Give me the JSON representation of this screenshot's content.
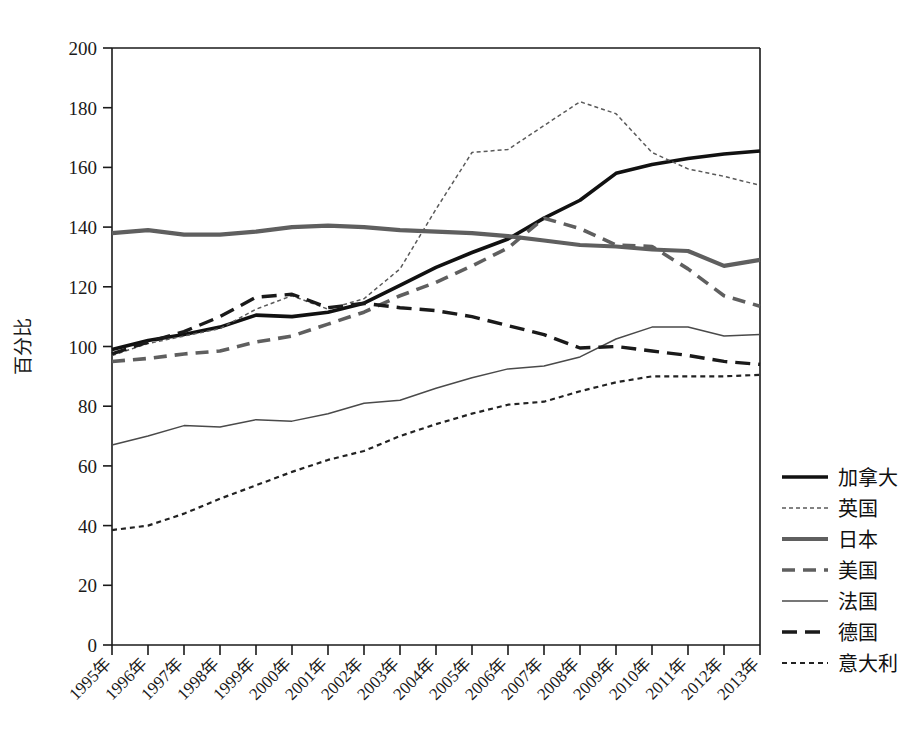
{
  "chart_data": {
    "type": "line",
    "title": "",
    "xlabel": "",
    "ylabel": "百分比",
    "ylim": [
      0,
      200
    ],
    "ytick_step": 20,
    "grid": false,
    "legend_position": "right",
    "x": [
      "1995年",
      "1996年",
      "1997年",
      "1998年",
      "1999年",
      "2000年",
      "2001年",
      "2002年",
      "2003年",
      "2004年",
      "2005年",
      "2006年",
      "2007年",
      "2008年",
      "2009年",
      "2010年",
      "2011年",
      "2012年",
      "2013年"
    ],
    "yticks": [
      0,
      20,
      40,
      60,
      80,
      100,
      120,
      140,
      160,
      180,
      200
    ],
    "series": [
      {
        "name": "加拿大",
        "style": "solid-thick-black",
        "color": "#111111",
        "width": 3.6,
        "dash": "",
        "values": [
          99,
          102,
          104,
          106.5,
          110.5,
          110,
          111.5,
          114.5,
          120.5,
          126.5,
          131.5,
          136,
          143,
          149,
          158,
          161,
          163,
          164.5,
          165.5
        ]
      },
      {
        "name": "英国",
        "style": "dotted-thin-gray",
        "color": "#5a5a5a",
        "width": 1.5,
        "dash": "4,3",
        "values": [
          97,
          101,
          103.5,
          106,
          112.5,
          117,
          112.5,
          116,
          126,
          146,
          165,
          166,
          174,
          182,
          178,
          165,
          159.5,
          157,
          154
        ]
      },
      {
        "name": "日本",
        "style": "solid-thick-gray",
        "color": "#5f5f5f",
        "width": 4.2,
        "dash": "",
        "values": [
          138,
          139,
          137.5,
          137.5,
          138.5,
          140,
          140.5,
          140,
          139,
          138.5,
          138,
          137,
          135.5,
          134,
          133.5,
          132.5,
          132,
          127,
          129
        ]
      },
      {
        "name": "美国",
        "style": "dashed-gray",
        "color": "#5f5f5f",
        "width": 3.6,
        "dash": "13,8",
        "values": [
          95,
          96,
          97.5,
          98.5,
          101.5,
          103.5,
          107.5,
          111.5,
          117,
          121.5,
          127,
          133,
          143,
          139.5,
          134,
          133.5,
          126,
          117,
          113.5
        ]
      },
      {
        "name": "法国",
        "style": "solid-thin-gray",
        "color": "#4a4a4a",
        "width": 1.5,
        "dash": "",
        "values": [
          67,
          70,
          73.5,
          73,
          75.5,
          75,
          77.5,
          81,
          82,
          86,
          89.5,
          92.5,
          93.5,
          96.5,
          102.5,
          106.5,
          106.5,
          103.5,
          104
        ]
      },
      {
        "name": "德国",
        "style": "dashed-black",
        "color": "#1a1a1a",
        "width": 3.4,
        "dash": "15,8",
        "values": [
          97.5,
          101.5,
          105,
          110,
          116.5,
          117.5,
          113,
          114.5,
          113,
          112,
          110,
          107,
          104,
          99.5,
          100,
          98.5,
          97,
          95,
          94
        ]
      },
      {
        "name": "意大利",
        "style": "dotted-fine-black",
        "color": "#222222",
        "width": 2.2,
        "dash": "5,4",
        "values": [
          38.5,
          40,
          44,
          49,
          53.5,
          58,
          62,
          65,
          70,
          74,
          77.5,
          80.5,
          81.5,
          85,
          88,
          90,
          90,
          90,
          90.5
        ]
      }
    ]
  },
  "legend": {
    "items": [
      {
        "label": "加拿大"
      },
      {
        "label": "英国"
      },
      {
        "label": "日本"
      },
      {
        "label": "美国"
      },
      {
        "label": "法国"
      },
      {
        "label": "德国"
      },
      {
        "label": "意大利"
      }
    ]
  }
}
